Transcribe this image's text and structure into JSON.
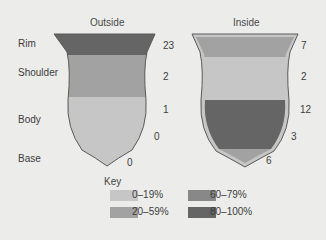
{
  "panels": {
    "outside": {
      "title": "Outside",
      "values": {
        "rim": "23",
        "shoulder": "2",
        "body": "1",
        "lower_body": "0",
        "base": "0"
      }
    },
    "inside": {
      "title": "Inside",
      "values": {
        "rim": "7",
        "shoulder": "2",
        "body": "12",
        "lower_body": "3",
        "base": "6"
      }
    }
  },
  "zones": [
    "Rim",
    "Shoulder",
    "Body",
    "Base"
  ],
  "key": {
    "title": "Key",
    "items": [
      {
        "label": "0–19%",
        "color": "#c6c6c6"
      },
      {
        "label": "20–59%",
        "color": "#a2a2a2"
      },
      {
        "label": "60–79%",
        "color": "#888888"
      },
      {
        "label": "80–100%",
        "color": "#656565"
      }
    ]
  }
}
